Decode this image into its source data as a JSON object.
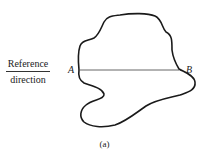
{
  "diagram": {
    "reference_label": {
      "numerator": "Reference",
      "denominator": "direction"
    },
    "points": {
      "a": "A",
      "b": "B"
    },
    "caption": "(a)",
    "colors": {
      "outline": "#1a1a1a",
      "chord": "#555555"
    }
  }
}
